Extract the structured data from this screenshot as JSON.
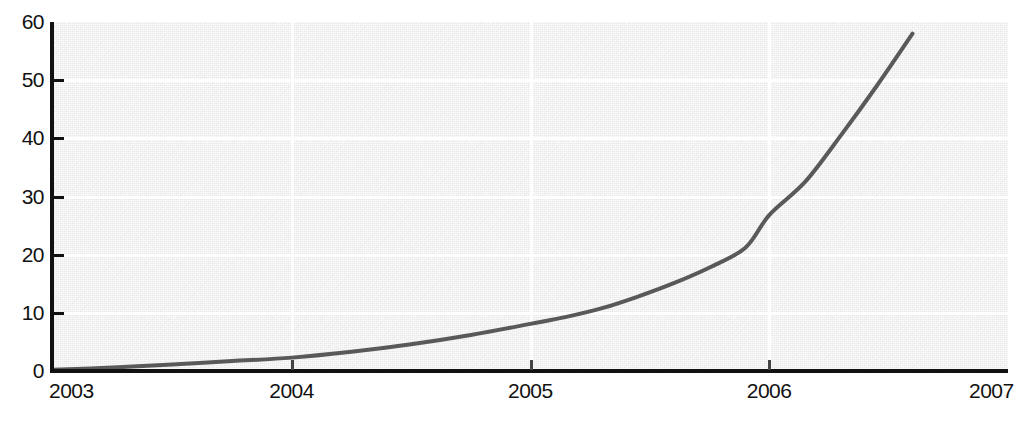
{
  "chart_data": {
    "type": "line",
    "title": "",
    "subtitle": "",
    "xlabel": "",
    "ylabel": "",
    "xlim": [
      2003,
      2007
    ],
    "ylim": [
      0,
      60
    ],
    "grid": true,
    "legend": null,
    "x_ticks": [
      "2003",
      "2004",
      "2005",
      "2006",
      "2007"
    ],
    "x_tick_values": [
      2003,
      2004,
      2005,
      2006,
      2007
    ],
    "y_ticks": [
      "0",
      "10",
      "20",
      "30",
      "40",
      "50",
      "60"
    ],
    "y_tick_values": [
      0,
      10,
      20,
      30,
      40,
      50,
      60
    ],
    "series": [
      {
        "name": "series-1",
        "color": "#58595b",
        "x": [
          2003.0,
          2003.25,
          2003.5,
          2003.75,
          2004.0,
          2004.25,
          2004.5,
          2004.75,
          2005.0,
          2005.15,
          2005.3,
          2005.45,
          2005.6,
          2005.75,
          2005.9,
          2006.0,
          2006.15,
          2006.3,
          2006.45,
          2006.6
        ],
        "values": [
          0.2,
          0.6,
          1.1,
          1.7,
          2.3,
          3.3,
          4.6,
          6.2,
          8.1,
          9.3,
          10.8,
          12.8,
          15.1,
          17.8,
          21.2,
          26.8,
          32.5,
          40.5,
          49.0,
          58.0
        ]
      }
    ],
    "annotations": [],
    "background_color": "#e9e9e9",
    "gridline_color": "#ffffff",
    "axis_color": "#111111"
  }
}
